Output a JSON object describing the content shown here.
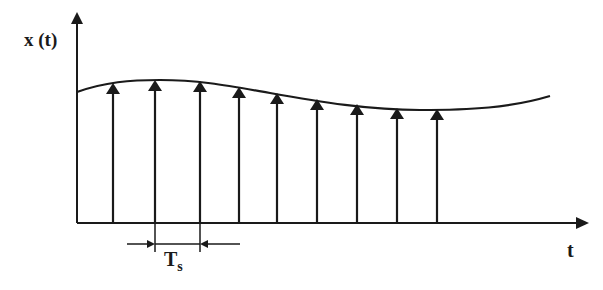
{
  "diagram": {
    "y_label": "x (t)",
    "x_label": "t",
    "period_label_main": "T",
    "period_label_sub": "s",
    "line_color": "#1a1a1a",
    "background": "#ffffff"
  },
  "geometry": {
    "y_axis_x": 77,
    "x_axis_y": 223,
    "samples": [
      {
        "x": 113,
        "y": 84
      },
      {
        "x": 155,
        "y": 81
      },
      {
        "x": 200,
        "y": 82
      },
      {
        "x": 239,
        "y": 88
      },
      {
        "x": 277,
        "y": 94
      },
      {
        "x": 317,
        "y": 100
      },
      {
        "x": 357,
        "y": 105
      },
      {
        "x": 397,
        "y": 109
      },
      {
        "x": 437,
        "y": 110
      }
    ]
  }
}
